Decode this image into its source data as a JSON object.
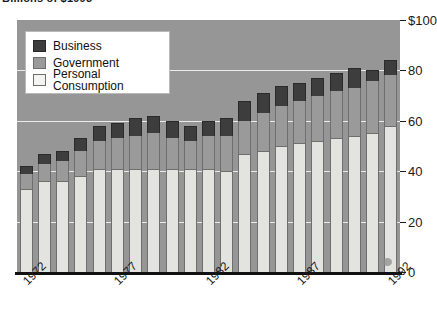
{
  "title": {
    "text": "Billions of $1993",
    "clipped": true
  },
  "legend": {
    "position": "top-left",
    "items": [
      {
        "label": "Business",
        "color": "#3d3d3d",
        "swatch": "business-swatch"
      },
      {
        "label": "Government",
        "color": "#9a9a9a",
        "swatch": "government-swatch"
      },
      {
        "label": "Personal Consumption",
        "color": "#f4f4f2",
        "swatch": "personal-consumption-swatch"
      }
    ]
  },
  "axes": {
    "y": {
      "labels": [
        "$100",
        "80",
        "60",
        "40",
        "20",
        "0"
      ],
      "values": [
        100,
        80,
        60,
        40,
        20,
        0
      ],
      "min": 0,
      "max": 100
    },
    "x": {
      "labels": [
        "1972",
        "1977",
        "1982",
        "1987",
        "1992"
      ],
      "label_years": [
        1972,
        1977,
        1982,
        1987,
        1992
      ],
      "rotation": "-45deg"
    }
  },
  "colors": {
    "plot_background": "#969696",
    "gridline": "#f2f2f2",
    "axis": "#111111",
    "page_background": "#ffffff"
  },
  "chart_data": {
    "type": "bar",
    "stacked": true,
    "title": "Billions of $1993",
    "xlabel": "",
    "ylabel": "",
    "ylim": [
      0,
      100
    ],
    "grid": true,
    "legend_position": "top-left",
    "categories": [
      "1972",
      "1973",
      "1974",
      "1975",
      "1976",
      "1977",
      "1978",
      "1979",
      "1980",
      "1981",
      "1982",
      "1983",
      "1984",
      "1985",
      "1986",
      "1987",
      "1988",
      "1989",
      "1990",
      "1991",
      "1992"
    ],
    "series": [
      {
        "name": "Personal Consumption",
        "color": "#f4f4f2",
        "values": [
          33,
          36,
          36,
          38,
          41,
          41,
          41,
          41,
          41,
          41,
          41,
          40,
          47,
          48,
          50,
          51,
          52,
          53,
          54,
          55,
          58
        ]
      },
      {
        "name": "Government",
        "color": "#9a9a9a",
        "values": [
          6,
          7,
          8,
          10,
          11,
          12,
          13,
          14,
          12,
          11,
          13,
          14,
          13,
          15,
          16,
          17,
          18,
          19,
          19,
          21,
          20
        ]
      },
      {
        "name": "Business",
        "color": "#3d3d3d",
        "values": [
          3,
          4,
          4,
          5,
          6,
          6,
          7,
          7,
          7,
          6,
          6,
          7,
          8,
          8,
          8,
          7,
          7,
          7,
          8,
          4,
          6
        ]
      }
    ],
    "totals": [
      42,
      47,
      48,
      53,
      58,
      59,
      61,
      62,
      60,
      58,
      60,
      61,
      68,
      71,
      74,
      75,
      77,
      79,
      81,
      80,
      84
    ]
  }
}
